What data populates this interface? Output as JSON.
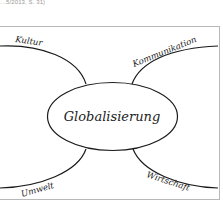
{
  "caption": "…5/2013, S. 31)",
  "mindmap": {
    "center": "Globalisierung",
    "branches": [
      {
        "label": "Kultur",
        "position": "top-left"
      },
      {
        "label": "Kommunikation",
        "position": "top-right"
      },
      {
        "label": "Umwelt",
        "position": "bottom-left"
      },
      {
        "label": "Wirtschaft",
        "position": "bottom-right"
      }
    ]
  },
  "colors": {
    "line": "#1a1a1a",
    "frame": "#b8b8b8",
    "caption": "#9a9a9a"
  }
}
